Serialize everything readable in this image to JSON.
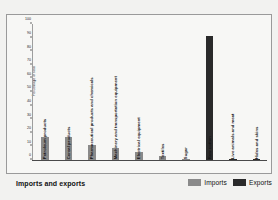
{
  "chart_data": {
    "type": "bar",
    "title": "Imports and exports",
    "xlabel": "",
    "ylabel": "Percentage of total",
    "ylim": [
      0,
      100
    ],
    "yticks": [
      0,
      10,
      20,
      30,
      40,
      50,
      60,
      70,
      80,
      90,
      100
    ],
    "grid": false,
    "legend_position": "bottom-right",
    "categories": [
      "Petroleum products",
      "Cereal products",
      "Pharmaceutical products and chemicals",
      "Machinery and transportation equipment",
      "Electrical equipment",
      "Textiles",
      "Sugar",
      "Raw cotton",
      "Live animals and meat",
      "Hides and skins"
    ],
    "series": [
      {
        "name": "Imports",
        "color": "#8a8a8a",
        "values": [
          17,
          17,
          11,
          9,
          6,
          3,
          1,
          0,
          0,
          0
        ]
      },
      {
        "name": "Exports",
        "color": "#2a2a2a",
        "values": [
          0,
          0,
          0,
          0,
          0,
          0,
          0,
          91,
          1,
          1
        ]
      }
    ]
  },
  "legend": {
    "items": [
      {
        "label": "Imports",
        "color": "#8a8a8a"
      },
      {
        "label": "Exports",
        "color": "#2a2a2a"
      }
    ]
  },
  "colors": {
    "imports": "#8a8a8a",
    "exports": "#2a2a2a",
    "background": "#f2f2f0",
    "plot_background": "#f7f7f5",
    "text": "#111111"
  }
}
